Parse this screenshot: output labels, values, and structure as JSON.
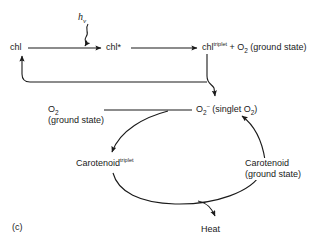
{
  "figure": {
    "panel_label": "(c)",
    "nodes": {
      "chl": "chl",
      "chl_excited": "chl*",
      "chl_triplet_base": "chl",
      "chl_triplet_sup": "triplet",
      "chl_triplet_rest": " + O",
      "chl_triplet_sub": "2",
      "chl_triplet_tail": " (ground state)",
      "photon": "h",
      "photon_sub": "v",
      "o2_ground_line1": "O",
      "o2_ground_sub": "2",
      "o2_ground_line2": "(ground state)",
      "superoxide_base": "O",
      "superoxide_sub": "2",
      "superoxide_sup": "–",
      "superoxide_rest": " (singlet O",
      "superoxide_rest_sub": "2",
      "superoxide_rest_tail": ")",
      "carotenoid_triplet_base": "Carotenoid",
      "carotenoid_triplet_sup": "triplet",
      "carotenoid_ground_line1": "Carotenoid",
      "carotenoid_ground_line2": "(ground state)",
      "heat": "Heat"
    },
    "colors": {
      "stroke": "#1a1a1a",
      "background": "#ffffff",
      "text": "#1a1a1a"
    }
  }
}
